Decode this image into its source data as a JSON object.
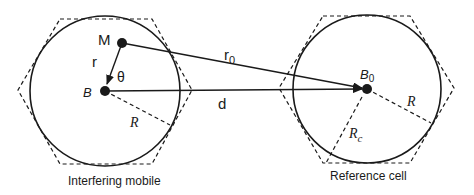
{
  "diagram": {
    "interfering_cell": {
      "caption": "Interfering mobile",
      "base_station_label": "B",
      "mobile_label": "M",
      "radius_label": "R",
      "distance_label": "r",
      "angle_label": "θ"
    },
    "reference_cell": {
      "caption": "Reference cell",
      "base_station_label": "B",
      "base_station_subscript": "0",
      "radius_label": "R",
      "cell_radius_label": "R",
      "cell_radius_subscript": "c"
    },
    "links": {
      "mobile_to_reference_label": "r",
      "mobile_to_reference_subscript": "0",
      "inter_bs_distance_label": "d"
    },
    "colors": {
      "stroke": "#1a1a1a",
      "background": "#ffffff"
    }
  }
}
